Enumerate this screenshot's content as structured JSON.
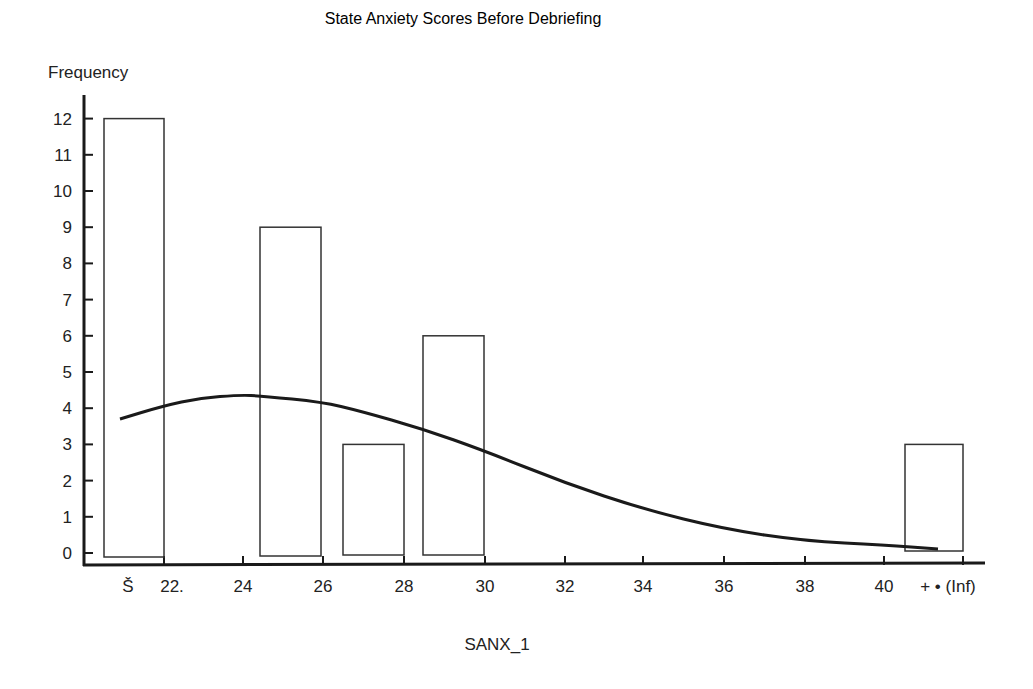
{
  "chart_data": {
    "type": "bar",
    "title": "State Anxiety Scores Before Debriefing",
    "xlabel": "SANX_1",
    "ylabel": "Frequency",
    "ylim": [
      0,
      12
    ],
    "y_ticks": [
      "0",
      "1",
      "2",
      "3",
      "4",
      "5",
      "6",
      "7",
      "8",
      "9",
      "10",
      "11",
      "12"
    ],
    "x_ticks": [
      "Š",
      "22.",
      "24",
      "26",
      "28",
      "30",
      "32",
      "34",
      "36",
      "38",
      "40",
      "+ • (Inf)"
    ],
    "categories": [
      "(-Inf) to 22",
      "24 to 26",
      "26 to 28",
      "28 to 30",
      "40 to Inf"
    ],
    "values": [
      12,
      9,
      3,
      6,
      3
    ],
    "overlay": {
      "type": "line",
      "name": "normal curve",
      "x": [
        20.9,
        22,
        24,
        25,
        26,
        28,
        30,
        32,
        34,
        36,
        38,
        40,
        41.3
      ],
      "y": [
        3.7,
        4.1,
        4.35,
        4.3,
        4.15,
        3.4,
        2.8,
        1.9,
        1.2,
        0.65,
        0.35,
        0.25,
        0.1
      ]
    },
    "grid": false,
    "legend": "none"
  }
}
